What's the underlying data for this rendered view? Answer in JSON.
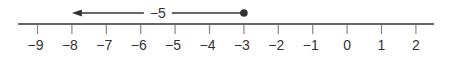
{
  "number_line": {
    "min": -9,
    "max": 2,
    "ticks": [
      {
        "value": -9,
        "label": "−9"
      },
      {
        "value": -8,
        "label": "−8"
      },
      {
        "value": -7,
        "label": "−7"
      },
      {
        "value": -6,
        "label": "−6"
      },
      {
        "value": -5,
        "label": "−5"
      },
      {
        "value": -4,
        "label": "−4"
      },
      {
        "value": -3,
        "label": "−3"
      },
      {
        "value": -2,
        "label": "−2"
      },
      {
        "value": -1,
        "label": "−1"
      },
      {
        "value": 0,
        "label": "0"
      },
      {
        "value": 1,
        "label": "1"
      },
      {
        "value": 2,
        "label": "2"
      }
    ]
  },
  "jump": {
    "start": -3,
    "end": -8,
    "label": "−5",
    "start_marker": "filled-dot",
    "end_marker": "arrowhead"
  },
  "colors": {
    "axis": "#333333",
    "tick": "#888888",
    "arrow": "#333333",
    "dot": "#333333"
  }
}
